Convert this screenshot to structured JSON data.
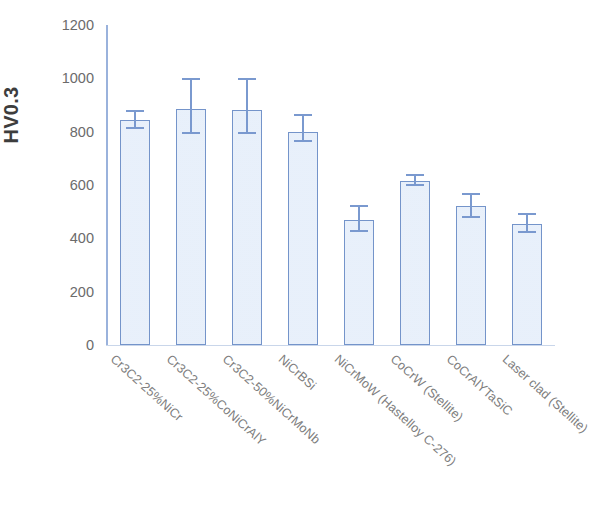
{
  "chart_data": {
    "type": "bar",
    "title": "",
    "subtitle": "",
    "xlabel": "",
    "ylabel": "HV0.3",
    "ylim": [
      0,
      1200
    ],
    "yticks": [
      0,
      200,
      400,
      600,
      800,
      1000,
      1200
    ],
    "grid": false,
    "legend": null,
    "orientation": "vertical",
    "bar_color": "#dbe8f8",
    "bar_border_color": "#7494ca",
    "error_bar_color": "#7a99cf",
    "categories": [
      "Cr3C2-25%NiCr",
      "Cr3C2-25%CoNiCrAlY",
      "Cr3C2-50%NiCrMoNb",
      "NiCrBSi",
      "NiCrMoW (Hastelloy C-276)",
      "CoCrW (Stellite)",
      "CoCrAlYTaSiC",
      "Laser clad (Stellite)"
    ],
    "values": [
      845,
      885,
      880,
      800,
      470,
      615,
      520,
      455
    ],
    "errors_upper": [
      880,
      1000,
      1000,
      865,
      525,
      640,
      570,
      495
    ],
    "errors_lower": [
      810,
      790,
      790,
      760,
      425,
      595,
      475,
      420
    ],
    "error_plus": [
      35,
      115,
      120,
      65,
      55,
      25,
      50,
      40
    ],
    "error_minus": [
      35,
      95,
      90,
      40,
      45,
      20,
      45,
      35
    ]
  },
  "axis": {
    "y_title": "HV0.3",
    "tick_labels": [
      "1200",
      "1000",
      "800",
      "600",
      "400",
      "200",
      "0"
    ]
  },
  "caption_fragment": ""
}
